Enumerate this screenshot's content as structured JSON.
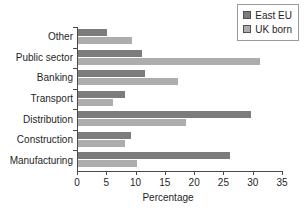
{
  "chart_data": {
    "type": "bar",
    "orientation": "horizontal",
    "title": "",
    "xlabel": "Percentage",
    "ylabel": "",
    "xlim": [
      0,
      35
    ],
    "xticks": [
      0,
      5,
      10,
      15,
      20,
      25,
      30,
      35
    ],
    "grid": false,
    "legend_position": "top-right",
    "categories": [
      "Other",
      "Public sector",
      "Banking",
      "Transport",
      "Distribution",
      "Construction",
      "Manufacturing"
    ],
    "series": [
      {
        "name": "East EU",
        "color": "#7c7c7c",
        "values": [
          5.0,
          11.0,
          11.5,
          8.0,
          29.5,
          9.0,
          26.0
        ]
      },
      {
        "name": "UK born",
        "color": "#adadad",
        "values": [
          9.3,
          31.0,
          17.0,
          6.0,
          18.5,
          8.0,
          10.0
        ]
      }
    ]
  },
  "legend": {
    "items": [
      {
        "label": "East EU",
        "color": "#7c7c7c"
      },
      {
        "label": "UK born",
        "color": "#adadad"
      }
    ]
  },
  "axis": {
    "x_title": "Percentage"
  }
}
